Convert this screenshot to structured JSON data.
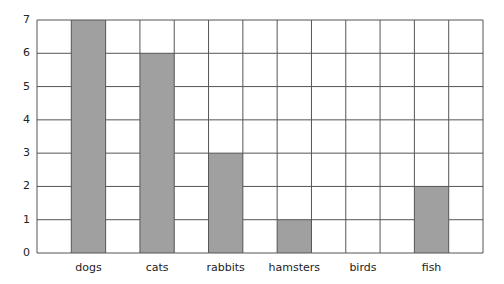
{
  "chart_data": {
    "type": "bar",
    "title": "",
    "xlabel": "",
    "ylabel": "",
    "categories": [
      "dogs",
      "cats",
      "rabbits",
      "hamsters",
      "birds",
      "fish"
    ],
    "values": [
      7,
      6,
      3,
      1,
      0,
      2
    ],
    "ylim": [
      0,
      7
    ],
    "yticks": [
      0,
      1,
      2,
      3,
      4,
      5,
      6,
      7
    ],
    "grid": true,
    "legend": null,
    "bar_color": "#a0a0a0",
    "grid_color": "#555555"
  },
  "y_tick_labels": [
    "0",
    "1",
    "2",
    "3",
    "4",
    "5",
    "6",
    "7"
  ]
}
